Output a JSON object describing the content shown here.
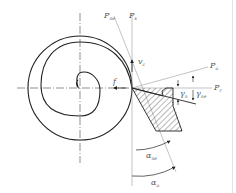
{
  "diagram": {
    "labels": {
      "P_ne": {
        "main": "P",
        "sub": "ne"
      },
      "P_s": {
        "main": "P",
        "sub": "s"
      },
      "v_c": {
        "main": "v",
        "sub": "c"
      },
      "f": {
        "main": "f"
      },
      "P_o": {
        "main": "P",
        "sub": "o"
      },
      "P_r": {
        "main": "P",
        "sub": "r"
      },
      "gamma_n": {
        "main": "γ",
        "sub": "n"
      },
      "gamma_ne": {
        "main": "γ",
        "sub": "ne"
      },
      "alpha_ne": {
        "main": "α",
        "sub": "ne"
      },
      "alpha_o": {
        "main": "α",
        "sub": "o"
      }
    },
    "colors": {
      "line": "#222222",
      "thin_line": "#9a9a9a",
      "label": "#555555",
      "background": "#ffffff"
    }
  }
}
